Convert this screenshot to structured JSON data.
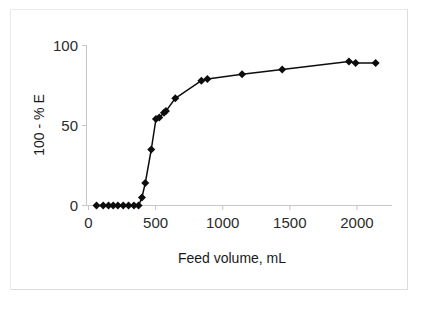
{
  "chart_data": {
    "type": "line",
    "title": "",
    "xlabel": "Feed volume, mL",
    "ylabel": "100 - % E",
    "xlim": [
      0,
      2250
    ],
    "ylim": [
      0,
      100
    ],
    "xticks": [
      0,
      500,
      1000,
      1500,
      2000
    ],
    "xtick_labels": [
      "0",
      "500",
      "1000",
      "1500",
      "2000"
    ],
    "yticks": [
      0,
      50,
      100
    ],
    "ytick_labels": [
      "0",
      "50",
      "100"
    ],
    "grid": false,
    "legend": false,
    "marker": "diamond",
    "marker_color": "#0d0d0d",
    "line_color": "#0d0d0d",
    "series": [
      {
        "name": "100 - % E",
        "x": [
          60,
          110,
          150,
          185,
          220,
          260,
          300,
          340,
          375,
          400,
          425,
          470,
          505,
          530,
          565,
          580,
          650,
          845,
          890,
          1150,
          1450,
          1950,
          2000,
          2150
        ],
        "y": [
          0,
          0,
          0,
          0,
          0,
          0,
          0,
          0,
          0,
          5,
          14,
          35,
          54,
          55,
          58,
          59,
          67,
          78,
          79,
          82,
          85,
          90,
          89,
          89
        ]
      }
    ]
  },
  "axes": {
    "x_title": "Feed volume, mL",
    "y_title": "100 - % E"
  }
}
